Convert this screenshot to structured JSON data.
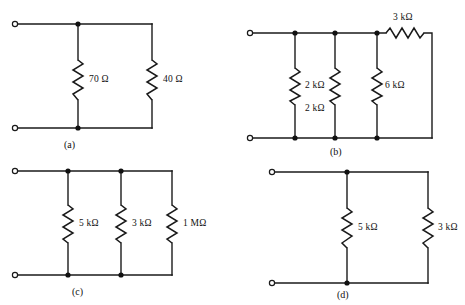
{
  "figure": {
    "background_color": "#ffffff",
    "line_color": "#1a1a1a",
    "ohm_symbol": "Ω"
  },
  "circuits": [
    {
      "id": "a",
      "caption": "(a)",
      "topology": "two resistors in parallel across a terminal pair",
      "terminals": [
        "top-left open terminal",
        "bottom-left open terminal"
      ],
      "components": [
        {
          "ref": "a-r1",
          "type": "resistor",
          "label": "70 Ω",
          "value": 70,
          "unit": "Ω",
          "orientation": "vertical"
        },
        {
          "ref": "a-r2",
          "type": "resistor",
          "label": "40 Ω",
          "value": 40,
          "unit": "Ω",
          "orientation": "vertical"
        }
      ]
    },
    {
      "id": "b",
      "caption": "(b)",
      "topology": "three parallel resistors with a series resistor in the top-right branch",
      "terminals": [
        "top-left open terminal",
        "bottom-left open terminal"
      ],
      "components": [
        {
          "ref": "b-r1",
          "type": "resistor",
          "label": "2 kΩ",
          "value": 2,
          "unit": "kΩ",
          "orientation": "vertical"
        },
        {
          "ref": "b-r2",
          "type": "resistor",
          "label": "2 kΩ",
          "value": 2,
          "unit": "kΩ",
          "orientation": "vertical"
        },
        {
          "ref": "b-r3",
          "type": "resistor",
          "label": "6 kΩ",
          "value": 6,
          "unit": "kΩ",
          "orientation": "vertical"
        },
        {
          "ref": "b-r4",
          "type": "resistor",
          "label": "3 kΩ",
          "value": 3,
          "unit": "kΩ",
          "orientation": "horizontal"
        }
      ]
    },
    {
      "id": "c",
      "caption": "(c)",
      "topology": "three resistors in parallel across a terminal pair",
      "terminals": [
        "top-left open terminal",
        "bottom-left open terminal"
      ],
      "components": [
        {
          "ref": "c-r1",
          "type": "resistor",
          "label": "5 kΩ",
          "value": 5,
          "unit": "kΩ",
          "orientation": "vertical"
        },
        {
          "ref": "c-r2",
          "type": "resistor",
          "label": "3 kΩ",
          "value": 3,
          "unit": "kΩ",
          "orientation": "vertical"
        },
        {
          "ref": "c-r3",
          "type": "resistor",
          "label": "1 MΩ",
          "value": 1,
          "unit": "MΩ",
          "orientation": "vertical"
        }
      ]
    },
    {
      "id": "d",
      "caption": "(d)",
      "topology": "two resistors in parallel across a terminal pair",
      "terminals": [
        "top-left open terminal",
        "bottom-left open terminal"
      ],
      "components": [
        {
          "ref": "d-r1",
          "type": "resistor",
          "label": "5 kΩ",
          "value": 5,
          "unit": "kΩ",
          "orientation": "vertical"
        },
        {
          "ref": "d-r2",
          "type": "resistor",
          "label": "3 kΩ",
          "value": 3,
          "unit": "kΩ",
          "orientation": "vertical"
        }
      ]
    }
  ]
}
